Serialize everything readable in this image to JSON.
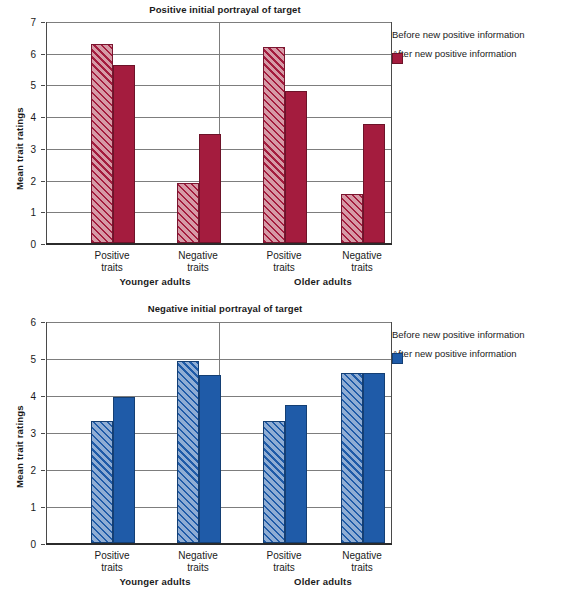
{
  "figure": {
    "caption": ""
  },
  "chart_data": [
    {
      "type": "bar",
      "title": "Positive initial portrayal of target",
      "xlabel": "",
      "ylabel": "Mean trait ratings",
      "ylim": [
        0,
        7
      ],
      "yticks": [
        "0",
        "1",
        "2",
        "3",
        "4",
        "5",
        "6",
        "7"
      ],
      "grid": true,
      "legend_position": "right",
      "accent_before": "#d69aa6",
      "accent_after": "#a41c3e",
      "groups": [
        "Younger adults",
        "Older adults"
      ],
      "categories": [
        "Positive traits",
        "Negative traits",
        "Positive traits",
        "Negative traits"
      ],
      "category_lines": [
        [
          "Positive",
          "traits"
        ],
        [
          "Negative",
          "traits"
        ],
        [
          "Positive",
          "traits"
        ],
        [
          "Negative",
          "traits"
        ]
      ],
      "series": [
        {
          "name": "Before new positive information",
          "values": [
            6.27,
            1.9,
            6.18,
            1.55
          ]
        },
        {
          "name": "After new positive information",
          "values": [
            5.6,
            3.45,
            4.8,
            3.75
          ]
        }
      ]
    },
    {
      "type": "bar",
      "title": "Negative initial portrayal of target",
      "xlabel": "",
      "ylabel": "Mean trait ratings",
      "ylim": [
        0,
        6
      ],
      "yticks": [
        "0",
        "1",
        "2",
        "3",
        "4",
        "5",
        "6"
      ],
      "grid": true,
      "legend_position": "right",
      "accent_before": "#8fadd4",
      "accent_after": "#1f5ba8",
      "groups": [
        "Younger adults",
        "Older adults"
      ],
      "categories": [
        "Positive traits",
        "Negative traits",
        "Positive traits",
        "Negative traits"
      ],
      "category_lines": [
        [
          "Positive",
          "traits"
        ],
        [
          "Negative",
          "traits"
        ],
        [
          "Positive",
          "traits"
        ],
        [
          "Negative",
          "traits"
        ]
      ],
      "series": [
        {
          "name": "Before new positive information",
          "values": [
            3.3,
            4.93,
            3.3,
            4.6
          ]
        },
        {
          "name": "After new positive information",
          "values": [
            3.95,
            4.53,
            3.73,
            4.6
          ]
        }
      ]
    }
  ]
}
